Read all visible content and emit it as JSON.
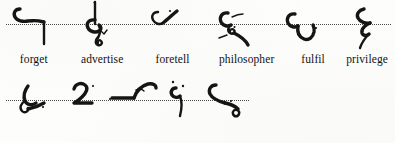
{
  "page": {
    "ink_color": "#151515",
    "paper_color": "#fdfdfc",
    "baseline_color": "#2b2b2b",
    "baseline_style": "dotted"
  },
  "rows": [
    {
      "id": "row-1",
      "baseline_label": "writing-line-1",
      "entries": [
        {
          "word": "forget",
          "outline_name": "shorthand-outline-forget"
        },
        {
          "word": "advertise",
          "outline_name": "shorthand-outline-advertise"
        },
        {
          "word": "foretell",
          "outline_name": "shorthand-outline-foretell"
        },
        {
          "word": "philosopher",
          "outline_name": "shorthand-outline-philosopher"
        },
        {
          "word": "fulfil",
          "outline_name": "shorthand-outline-fulfil"
        },
        {
          "word": "privilege",
          "outline_name": "shorthand-outline-privilege"
        }
      ]
    },
    {
      "id": "row-2",
      "baseline_label": "writing-line-2",
      "entries": [
        {
          "word": "chivalry",
          "outline_name": "shorthand-outline-chivalry"
        },
        {
          "word": "shellac",
          "outline_name": "shorthand-outline-shellac"
        },
        {
          "word": "calomel",
          "outline_name": "shorthand-outline-calomel"
        },
        {
          "word": "average",
          "outline_name": "shorthand-outline-average"
        },
        {
          "word": "verbose",
          "outline_name": "shorthand-outline-verbose"
        }
      ]
    }
  ]
}
